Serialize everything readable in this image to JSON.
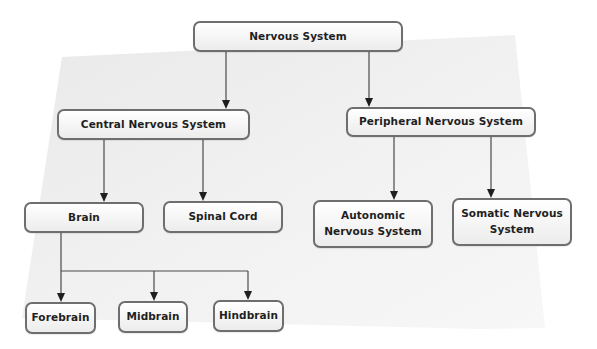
{
  "diagram": {
    "type": "hierarchy",
    "colors": {
      "background_panel": "#efefef",
      "box_border": "#6e6e6e",
      "box_fill": "#f4f4f4",
      "text": "#1f1f1f",
      "edge": "#4a4a4a"
    },
    "nodes": {
      "root": {
        "label": "Nervous System"
      },
      "cns": {
        "label": "Central Nervous System"
      },
      "pns": {
        "label": "Peripheral Nervous System"
      },
      "brain": {
        "label": "Brain"
      },
      "spinal_cord": {
        "label": "Spinal Cord"
      },
      "autonomic": {
        "label_line1": "Autonomic",
        "label_line2": "Nervous System"
      },
      "somatic": {
        "label_line1": "Somatic Nervous",
        "label_line2": "System"
      },
      "forebrain": {
        "label": "Forebrain"
      },
      "midbrain": {
        "label": "Midbrain"
      },
      "hindbrain": {
        "label": "Hindbrain"
      }
    },
    "edges": [
      [
        "Nervous System",
        "Central Nervous System"
      ],
      [
        "Nervous System",
        "Peripheral Nervous System"
      ],
      [
        "Central Nervous System",
        "Brain"
      ],
      [
        "Central Nervous System",
        "Spinal Cord"
      ],
      [
        "Peripheral Nervous System",
        "Autonomic Nervous System"
      ],
      [
        "Peripheral Nervous System",
        "Somatic Nervous System"
      ],
      [
        "Brain",
        "Forebrain"
      ],
      [
        "Brain",
        "Midbrain"
      ],
      [
        "Brain",
        "Hindbrain"
      ]
    ]
  }
}
